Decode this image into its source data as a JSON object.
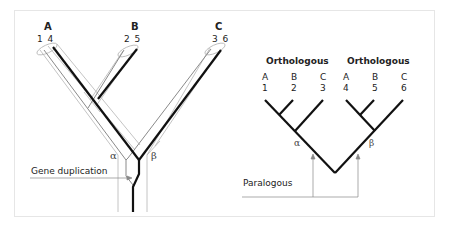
{
  "left_panel": {
    "species": [
      {
        "name": "A",
        "genes": "1 4"
      },
      {
        "name": "B",
        "genes": "2 5"
      },
      {
        "name": "C",
        "genes": "3 6"
      }
    ],
    "alpha_label": "α",
    "beta_label": "β",
    "duplication_label": "Gene duplication"
  },
  "right_panel": {
    "groups": [
      {
        "title": "Orthologous",
        "leaves": [
          {
            "species": "A",
            "gene": "1"
          },
          {
            "species": "B",
            "gene": "2"
          },
          {
            "species": "C",
            "gene": "3"
          }
        ]
      },
      {
        "title": "Orthologous",
        "leaves": [
          {
            "species": "A",
            "gene": "4"
          },
          {
            "species": "B",
            "gene": "5"
          },
          {
            "species": "C",
            "gene": "6"
          }
        ]
      }
    ],
    "alpha_label": "α",
    "beta_label": "β",
    "paralogous_label": "Paralogous"
  },
  "colors": {
    "thick_line": "#111111",
    "thin_line": "#9a9a9a",
    "outline": "#b5b5b5",
    "frame": "#e6e6e6"
  }
}
